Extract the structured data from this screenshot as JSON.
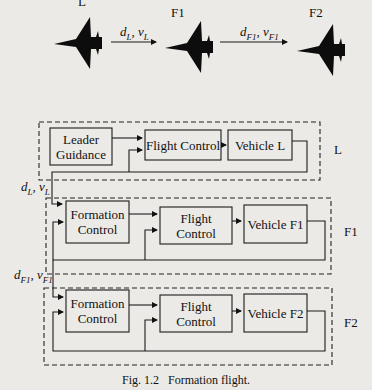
{
  "top_row": {
    "planes": [
      {
        "id": "L",
        "label": "L"
      },
      {
        "id": "F1",
        "label": "F1"
      },
      {
        "id": "F2",
        "label": "F2"
      }
    ],
    "arrows": [
      {
        "from": "L",
        "to": "F1",
        "label_d": "d",
        "label_d_sub": "L",
        "label_v": "v",
        "label_v_sub": "L"
      },
      {
        "from": "F1",
        "to": "F2",
        "label_d": "d",
        "label_d_sub": "F1",
        "label_v": "v",
        "label_v_sub": "F1"
      }
    ]
  },
  "groups": [
    {
      "id": "L",
      "label": "L",
      "blocks": [
        {
          "id": "leader-guidance",
          "line1": "Leader",
          "line2": "Guidance"
        },
        {
          "id": "flight-control-l",
          "label": "Flight Control"
        },
        {
          "id": "vehicle-l",
          "label": "Vehicle L"
        }
      ]
    },
    {
      "id": "F1",
      "label": "F1",
      "input_d": "d",
      "input_d_sub": "L",
      "input_v": "v",
      "input_v_sub": "L",
      "blocks": [
        {
          "id": "formation-control-f1",
          "line1": "Formation",
          "line2": "Control"
        },
        {
          "id": "flight-control-f1",
          "label": "Flight Control"
        },
        {
          "id": "vehicle-f1",
          "label": "Vehicle F1"
        }
      ]
    },
    {
      "id": "F2",
      "label": "F2",
      "input_d": "d",
      "input_d_sub": "F1",
      "input_v": "v",
      "input_v_sub": "F1",
      "blocks": [
        {
          "id": "formation-control-f2",
          "line1": "Formation",
          "line2": "Control"
        },
        {
          "id": "flight-control-f2",
          "label": "Flight Control"
        },
        {
          "id": "vehicle-f2",
          "label": "Vehicle F2"
        }
      ]
    }
  ],
  "caption": {
    "number": "Fig. 1.2",
    "text": "Formation flight."
  }
}
